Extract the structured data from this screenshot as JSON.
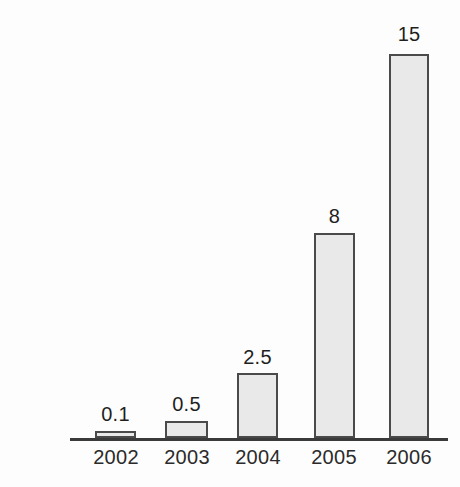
{
  "chart_data": {
    "type": "bar",
    "title": "",
    "subtitle": "",
    "xlabel": "",
    "ylabel": "",
    "categories": [
      "2002",
      "2003",
      "2004",
      "2005",
      "2006"
    ],
    "values": [
      0.1,
      0.5,
      2.5,
      8,
      15
    ],
    "value_labels": [
      "0.1",
      "0.5",
      "2.5",
      "8",
      "15"
    ],
    "series": [
      {
        "name": "",
        "values": [
          0.1,
          0.5,
          2.5,
          8,
          15
        ]
      }
    ],
    "ylim": [
      0,
      15
    ],
    "grid": false,
    "legend": false,
    "legend_position": "none",
    "y_axis_visible": false,
    "x_axis_visible": true,
    "annotations": []
  },
  "style": {
    "bar_fill": "#e9e9e9",
    "bar_border": "#4a4a4a",
    "axis_color": "#3a3a3a",
    "label_color": "#1f1f1f",
    "tick_color": "#2b2b2b",
    "background": "#fdfdfd"
  },
  "geometry": {
    "baseline_y": 438,
    "axis_left": 70,
    "axis_right": 448,
    "bars": [
      {
        "left": 95,
        "width": 41,
        "top": 431
      },
      {
        "left": 165,
        "width": 43,
        "top": 421
      },
      {
        "left": 237,
        "width": 41,
        "top": 373
      },
      {
        "left": 314,
        "width": 41,
        "top": 233
      },
      {
        "left": 389,
        "width": 40,
        "top": 54
      }
    ],
    "value_label_tops": [
      404,
      394,
      347,
      206,
      24
    ],
    "tick_centers": [
      116,
      187,
      258,
      334,
      409
    ]
  }
}
